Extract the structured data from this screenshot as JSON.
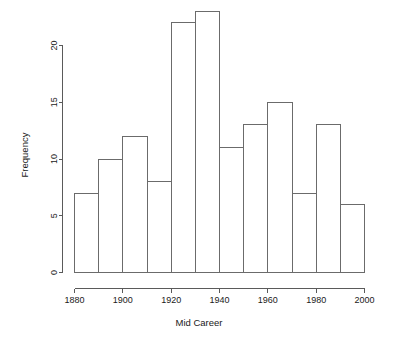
{
  "chart_data": {
    "type": "bar",
    "title": "",
    "subtitle": "",
    "xlabel": "Mid Career",
    "ylabel": "Frequency",
    "categories": [
      "1880-1890",
      "1890-1900",
      "1900-1910",
      "1910-1920",
      "1920-1930",
      "1930-1940",
      "1940-1950",
      "1950-1960",
      "1960-1970",
      "1970-1980",
      "1980-1990",
      "1990-2000"
    ],
    "bin_edges": [
      1880,
      1890,
      1900,
      1910,
      1920,
      1930,
      1940,
      1950,
      1960,
      1970,
      1980,
      1990,
      2000
    ],
    "values": [
      7,
      10,
      12,
      8,
      22,
      23,
      11,
      13,
      15,
      7,
      13,
      6
    ],
    "bin_width": 10,
    "xlim": [
      1880,
      2000
    ],
    "ylim": [
      0,
      23
    ],
    "x_ticks": [
      1880,
      1900,
      1920,
      1940,
      1960,
      1980,
      2000
    ],
    "x_tick_labels": [
      "1880",
      "1900",
      "1920",
      "1940",
      "1960",
      "1980",
      "2000"
    ],
    "y_ticks": [
      0,
      5,
      10,
      15,
      20
    ],
    "y_tick_labels": [
      "0",
      "5",
      "10",
      "15",
      "20"
    ],
    "grid": false,
    "legend": false,
    "legend_position": "none",
    "colors": {
      "background": "#ffffff",
      "bar_fill": "#ffffff",
      "bar_stroke": "#6b6b6b",
      "axis": "#5a5a5a",
      "text": "#1a1a1a"
    }
  }
}
